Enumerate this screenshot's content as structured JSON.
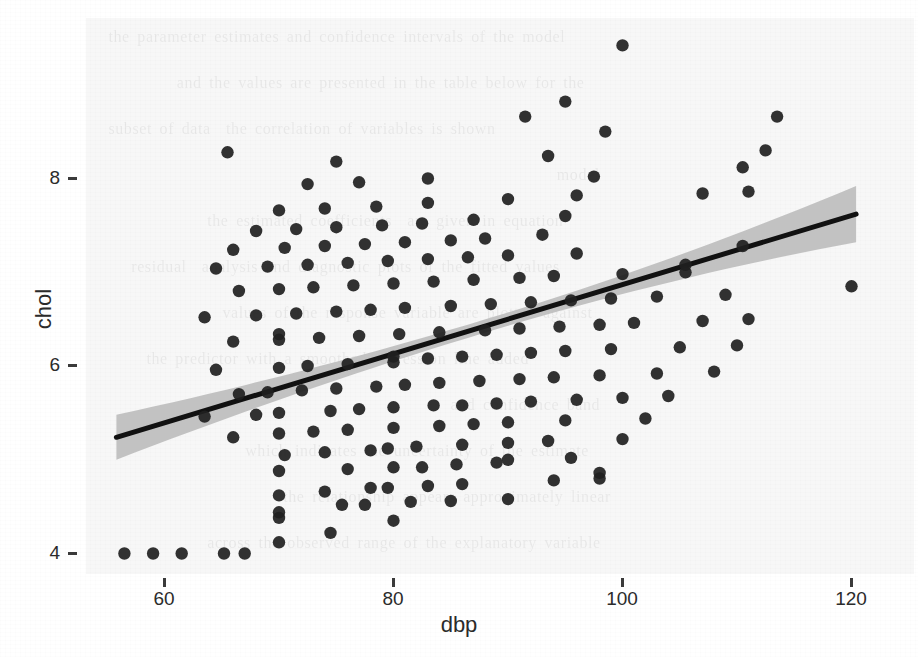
{
  "figure": {
    "type": "scatter-with-regression",
    "background_color": "#f7f7f7",
    "point_color": "#1f1f1f",
    "line_color": "#111111",
    "ribbon_color": "#bfbfbf"
  },
  "axis": {
    "x_title": "dbp",
    "y_title": "chol",
    "x_ticks": [
      "60",
      "80",
      "100",
      "120"
    ],
    "y_ticks": [
      "8",
      "6",
      "4"
    ]
  },
  "chart_data": {
    "type": "scatter",
    "title": "",
    "xlabel": "dbp",
    "ylabel": "chol",
    "xlim": [
      54,
      121.5
    ],
    "ylim": [
      3.85,
      9.6
    ],
    "xticks": [
      60,
      80,
      100,
      120
    ],
    "yticks": [
      4,
      6,
      8
    ],
    "grid": false,
    "legend": "none",
    "series": [
      {
        "name": "observations",
        "marker": "filled-circle",
        "color": "#1f1f1f",
        "points": [
          [
            56.5,
            4.0
          ],
          [
            59.0,
            4.0
          ],
          [
            61.5,
            4.0
          ],
          [
            65.2,
            4.0
          ],
          [
            67.0,
            4.0
          ],
          [
            70.0,
            4.12
          ],
          [
            74.5,
            4.22
          ],
          [
            80.0,
            4.35
          ],
          [
            70.0,
            4.38
          ],
          [
            70.0,
            4.44
          ],
          [
            75.5,
            4.52
          ],
          [
            77.5,
            4.52
          ],
          [
            81.5,
            4.55
          ],
          [
            85.0,
            4.56
          ],
          [
            90.0,
            4.58
          ],
          [
            70.0,
            4.62
          ],
          [
            74.0,
            4.66
          ],
          [
            78.0,
            4.7
          ],
          [
            79.5,
            4.7
          ],
          [
            83.0,
            4.72
          ],
          [
            86.0,
            4.74
          ],
          [
            94.0,
            4.78
          ],
          [
            98.0,
            4.8
          ],
          [
            98.0,
            4.86
          ],
          [
            70.0,
            4.88
          ],
          [
            76.0,
            4.9
          ],
          [
            80.0,
            4.92
          ],
          [
            82.5,
            4.92
          ],
          [
            85.5,
            4.95
          ],
          [
            89.0,
            4.97
          ],
          [
            90.0,
            5.0
          ],
          [
            95.5,
            5.02
          ],
          [
            70.5,
            5.05
          ],
          [
            74.0,
            5.08
          ],
          [
            78.0,
            5.1
          ],
          [
            79.5,
            5.12
          ],
          [
            82.0,
            5.14
          ],
          [
            86.0,
            5.16
          ],
          [
            90.0,
            5.18
          ],
          [
            93.5,
            5.2
          ],
          [
            100.0,
            5.22
          ],
          [
            66.0,
            5.24
          ],
          [
            70.0,
            5.28
          ],
          [
            73.0,
            5.3
          ],
          [
            76.0,
            5.32
          ],
          [
            80.0,
            5.34
          ],
          [
            84.0,
            5.36
          ],
          [
            87.0,
            5.38
          ],
          [
            90.0,
            5.4
          ],
          [
            95.0,
            5.42
          ],
          [
            102.0,
            5.44
          ],
          [
            63.5,
            5.46
          ],
          [
            68.0,
            5.48
          ],
          [
            70.0,
            5.5
          ],
          [
            74.5,
            5.52
          ],
          [
            77.0,
            5.54
          ],
          [
            80.0,
            5.56
          ],
          [
            83.5,
            5.58
          ],
          [
            86.0,
            5.58
          ],
          [
            89.0,
            5.6
          ],
          [
            92.0,
            5.62
          ],
          [
            96.0,
            5.64
          ],
          [
            100.0,
            5.66
          ],
          [
            104.0,
            5.68
          ],
          [
            66.5,
            5.7
          ],
          [
            69.0,
            5.72
          ],
          [
            72.0,
            5.74
          ],
          [
            75.0,
            5.76
          ],
          [
            78.5,
            5.78
          ],
          [
            81.0,
            5.8
          ],
          [
            84.0,
            5.82
          ],
          [
            87.5,
            5.84
          ],
          [
            91.0,
            5.86
          ],
          [
            94.0,
            5.88
          ],
          [
            98.0,
            5.9
          ],
          [
            103.0,
            5.92
          ],
          [
            108.0,
            5.94
          ],
          [
            64.5,
            5.96
          ],
          [
            70.0,
            5.98
          ],
          [
            72.5,
            6.0
          ],
          [
            76.0,
            6.02
          ],
          [
            80.0,
            6.04
          ],
          [
            80.0,
            6.1
          ],
          [
            83.0,
            6.08
          ],
          [
            86.0,
            6.1
          ],
          [
            89.0,
            6.12
          ],
          [
            92.0,
            6.14
          ],
          [
            95.0,
            6.16
          ],
          [
            99.0,
            6.18
          ],
          [
            105.0,
            6.2
          ],
          [
            110.0,
            6.22
          ],
          [
            66.0,
            6.26
          ],
          [
            70.0,
            6.28
          ],
          [
            70.0,
            6.34
          ],
          [
            73.5,
            6.3
          ],
          [
            77.0,
            6.32
          ],
          [
            80.5,
            6.34
          ],
          [
            84.0,
            6.36
          ],
          [
            88.0,
            6.38
          ],
          [
            91.0,
            6.4
          ],
          [
            94.5,
            6.42
          ],
          [
            98.0,
            6.44
          ],
          [
            101.0,
            6.46
          ],
          [
            107.0,
            6.48
          ],
          [
            111.0,
            6.5
          ],
          [
            63.5,
            6.52
          ],
          [
            68.0,
            6.54
          ],
          [
            71.5,
            6.56
          ],
          [
            75.0,
            6.58
          ],
          [
            78.0,
            6.6
          ],
          [
            81.0,
            6.62
          ],
          [
            85.0,
            6.64
          ],
          [
            88.5,
            6.66
          ],
          [
            92.0,
            6.68
          ],
          [
            95.5,
            6.7
          ],
          [
            99.0,
            6.72
          ],
          [
            103.0,
            6.74
          ],
          [
            109.0,
            6.76
          ],
          [
            120.0,
            6.85
          ],
          [
            66.5,
            6.8
          ],
          [
            70.0,
            6.82
          ],
          [
            73.0,
            6.84
          ],
          [
            76.5,
            6.86
          ],
          [
            80.0,
            6.88
          ],
          [
            83.5,
            6.9
          ],
          [
            87.0,
            6.92
          ],
          [
            91.0,
            6.94
          ],
          [
            94.0,
            6.96
          ],
          [
            100.0,
            6.98
          ],
          [
            105.5,
            7.0
          ],
          [
            64.5,
            7.04
          ],
          [
            69.0,
            7.06
          ],
          [
            72.5,
            7.08
          ],
          [
            76.0,
            7.1
          ],
          [
            79.5,
            7.12
          ],
          [
            83.0,
            7.14
          ],
          [
            86.5,
            7.16
          ],
          [
            90.0,
            7.18
          ],
          [
            96.0,
            7.2
          ],
          [
            110.5,
            7.28
          ],
          [
            105.5,
            7.08
          ],
          [
            66.0,
            7.24
          ],
          [
            70.5,
            7.26
          ],
          [
            74.0,
            7.28
          ],
          [
            77.5,
            7.3
          ],
          [
            81.0,
            7.32
          ],
          [
            85.0,
            7.34
          ],
          [
            88.0,
            7.36
          ],
          [
            93.0,
            7.4
          ],
          [
            68.0,
            7.44
          ],
          [
            71.5,
            7.46
          ],
          [
            75.0,
            7.48
          ],
          [
            79.0,
            7.5
          ],
          [
            82.5,
            7.52
          ],
          [
            87.0,
            7.56
          ],
          [
            95.0,
            7.6
          ],
          [
            70.0,
            7.66
          ],
          [
            74.0,
            7.68
          ],
          [
            78.5,
            7.7
          ],
          [
            83.0,
            7.74
          ],
          [
            90.0,
            7.78
          ],
          [
            96.0,
            7.82
          ],
          [
            107.0,
            7.84
          ],
          [
            111.0,
            7.86
          ],
          [
            72.5,
            7.94
          ],
          [
            77.0,
            7.96
          ],
          [
            83.0,
            8.0
          ],
          [
            97.5,
            8.02
          ],
          [
            110.5,
            8.12
          ],
          [
            65.5,
            8.28
          ],
          [
            75.0,
            8.18
          ],
          [
            93.5,
            8.24
          ],
          [
            112.5,
            8.3
          ],
          [
            98.5,
            8.5
          ],
          [
            91.5,
            8.66
          ],
          [
            113.5,
            8.66
          ],
          [
            95.0,
            8.82
          ],
          [
            100.0,
            9.42
          ]
        ]
      }
    ],
    "regression": {
      "name": "linear fit with 95% confidence band",
      "line_color": "#111111",
      "ribbon_color": "#bfbfbf",
      "x_start": 55.8,
      "x_end": 120.4,
      "y_start": 5.24,
      "y_end": 7.62,
      "slope": 0.0368,
      "intercept": 3.18,
      "band_half_width_start": 0.24,
      "band_half_width_mid": 0.07,
      "band_half_width_end": 0.3
    }
  }
}
